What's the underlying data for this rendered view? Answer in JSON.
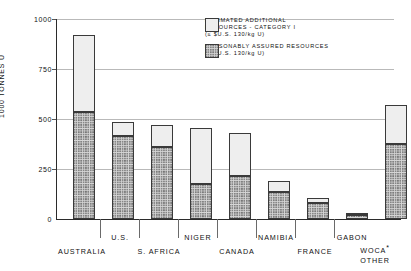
{
  "chart_data": {
    "type": "bar",
    "stacked": true,
    "title": "",
    "xlabel": "",
    "ylabel": "1000 TONNES U",
    "ylim": [
      0,
      1000
    ],
    "yticks": [
      0,
      250,
      500,
      750,
      1000
    ],
    "ytick_labels": [
      "0",
      "250",
      "500",
      "750",
      "1000"
    ],
    "grid": true,
    "legend_position": "top-right",
    "categories": [
      "AUSTRALIA",
      "U.S.",
      "S. AFRICA",
      "NIGER",
      "CANADA",
      "NAMIBIA",
      "FRANCE",
      "GABON",
      "WOCA* OTHER"
    ],
    "series": [
      {
        "name": "REASONABLY ASSURED RESOURCES",
        "values": [
          535,
          415,
          360,
          175,
          215,
          135,
          80,
          22,
          375
        ]
      },
      {
        "name": "ESTIMATED ADDITIONAL RESOURCES - CATEGORY I",
        "values": [
          385,
          70,
          108,
          280,
          215,
          55,
          25,
          8,
          195
        ]
      }
    ],
    "totals": [
      920,
      485,
      468,
      455,
      430,
      190,
      105,
      30,
      570
    ]
  },
  "legend": {
    "entries": [
      {
        "swatch": "ear-swatch",
        "line1": "ESTIMATED ADDITIONAL",
        "line2": "RESOURCES - CATEGORY I",
        "line3": "(≤ $U.S. 130/kg U)"
      },
      {
        "swatch": "rar-swatch",
        "line1": "REASONABLY ASSURED RESOURCES",
        "line2": "(≤ $U.S. 130/kg U)",
        "line3": ""
      }
    ]
  },
  "axis": {
    "y_title": "1000 TONNES U",
    "y_labels": {
      "t1000": "1000",
      "t750": "750",
      "t500": "500",
      "t250": "250",
      "t0": "0"
    }
  },
  "categories": {
    "australia": "AUSTRALIA",
    "us": "U.S.",
    "safrica": "S. AFRICA",
    "niger": "NIGER",
    "canada": "CANADA",
    "namibia": "NAMIBIA",
    "france": "FRANCE",
    "gabon": "GABON",
    "woca_line1": "WOCA",
    "woca_star": "*",
    "woca_line2": "OTHER"
  },
  "colors": {
    "ear_fill": "#eeeeee",
    "rar_fill": "#d6d6d6",
    "outline": "#3a3a3a",
    "gridline": "#b9b9b9",
    "axis": "#2b2b2b",
    "text": "#111111"
  }
}
